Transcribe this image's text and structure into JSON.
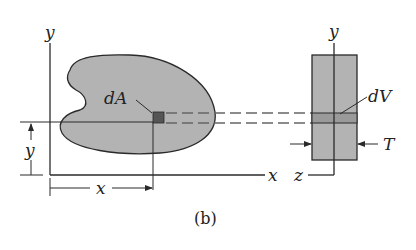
{
  "figure": {
    "caption": "(b)",
    "colors": {
      "fill": "#b3b3b3",
      "line": "#2a2a2a",
      "element": "#555555",
      "strip": "#9a9a9a",
      "background": "#ffffff"
    }
  },
  "left_view": {
    "axis_y_label": "y",
    "axis_x_label": "x",
    "element_label": "dA",
    "dim_y_label": "y",
    "dim_x_label": "x"
  },
  "right_view": {
    "axis_y_label": "y",
    "axis_z_label": "z",
    "element_label": "dV",
    "thickness_label": "T"
  }
}
